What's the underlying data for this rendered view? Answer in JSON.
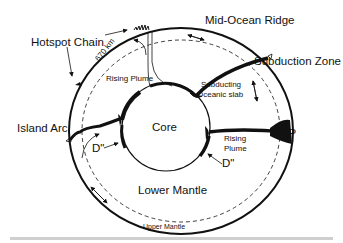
{
  "diagram": {
    "type": "cross-section of Earth's mantle convection",
    "labels": {
      "mid_ocean_ridge": "Mid-Ocean Ridge",
      "hotspot_chain": "Hotspot Chain",
      "subduction_zone": "Subduction Zone",
      "island_arc": "Island Arc",
      "lip": "LIP",
      "core": "Core",
      "lower_mantle": "Lower Mantle",
      "upper_mantle": "Upper Mantle",
      "rising_plume_top": "Rising Plume",
      "rising_plume_right_1": "Rising",
      "rising_plume_right_2": "Plume",
      "subducting_slab_1": "Subducting",
      "subducting_slab_2": "Oceanic slab",
      "d_double_prime_left": "D\"",
      "d_double_prime_right": "D\"",
      "depth_670": "670 km"
    },
    "colors": {
      "line": "#111111",
      "background": "#ffffff",
      "footer_bar": "#cfcfcf"
    }
  }
}
